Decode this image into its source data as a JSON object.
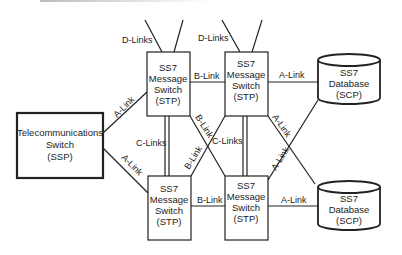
{
  "diagram": {
    "type": "SS7 signaling network",
    "nodes": {
      "ssp": {
        "lines": [
          "Telecommunications",
          "Switch",
          "(SSP)"
        ]
      },
      "stp_tl": {
        "lines": [
          "SS7",
          "Message",
          "Switch",
          "(STP)"
        ]
      },
      "stp_tr": {
        "lines": [
          "SS7",
          "Message",
          "Switch",
          "(STP)"
        ]
      },
      "stp_bl": {
        "lines": [
          "SS7",
          "Message",
          "Switch",
          "(STP)"
        ]
      },
      "stp_br": {
        "lines": [
          "SS7",
          "Message",
          "Switch",
          "(STP)"
        ]
      },
      "scp_top": {
        "lines": [
          "SS7",
          "Database",
          "(SCP)"
        ]
      },
      "scp_bottom": {
        "lines": [
          "SS7",
          "Database",
          "(SCP)"
        ]
      }
    },
    "links": {
      "d_links_left": "D-Links",
      "d_links_right": "D-Links",
      "a_link_ssp_top": "A-Link",
      "a_link_ssp_bottom": "A-Link",
      "b_link_top": "B-Link",
      "b_link_bottom": "B-Link",
      "b_link_diag1": "B-Link",
      "b_link_diag2": "B-Link",
      "c_links_left": "C-Links",
      "c_links_right": "C-Links",
      "a_link_scp_top": "A-Link",
      "a_link_scp_bottom": "A-Link",
      "a_link_diag1": "A-Link",
      "a_link_diag2": "A-Link"
    }
  }
}
